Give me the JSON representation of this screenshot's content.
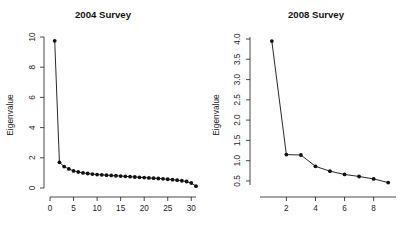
{
  "figure": {
    "background": "#ffffff",
    "foreground": "#111111",
    "panels": 2
  },
  "chart_data": [
    {
      "type": "line",
      "title": "2004 Survey",
      "xlabel": "",
      "ylabel": "Eigenvalue",
      "grid": false,
      "legend": "none",
      "marker": "filled-circle",
      "xlim": [
        0,
        31
      ],
      "ylim": [
        0,
        10
      ],
      "xticks": [
        0,
        5,
        10,
        15,
        20,
        25,
        30
      ],
      "yticks": [
        0,
        2,
        4,
        6,
        8,
        10
      ],
      "x": [
        1,
        2,
        3,
        4,
        5,
        6,
        7,
        8,
        9,
        10,
        11,
        12,
        13,
        14,
        15,
        16,
        17,
        18,
        19,
        20,
        21,
        22,
        23,
        24,
        25,
        26,
        27,
        28,
        29,
        30,
        31
      ],
      "values": [
        9.75,
        1.7,
        1.42,
        1.26,
        1.13,
        1.06,
        1.0,
        0.96,
        0.92,
        0.89,
        0.87,
        0.85,
        0.83,
        0.81,
        0.79,
        0.77,
        0.75,
        0.73,
        0.71,
        0.69,
        0.67,
        0.65,
        0.63,
        0.61,
        0.58,
        0.55,
        0.52,
        0.48,
        0.43,
        0.33,
        0.12
      ]
    },
    {
      "type": "line",
      "title": "2008 Survey",
      "xlabel": "",
      "ylabel": "Eigenvalue",
      "grid": false,
      "legend": "none",
      "marker": "filled-circle",
      "xlim": [
        0.6,
        9.4
      ],
      "ylim": [
        0.4,
        4.05
      ],
      "xticks": [
        2,
        4,
        6,
        8
      ],
      "yticks": [
        "0.5",
        "1.0",
        "1.5",
        "2.0",
        "2.5",
        "3.0",
        "3.5",
        "4.0"
      ],
      "ytick_values": [
        0.5,
        1.0,
        1.5,
        2.0,
        2.5,
        3.0,
        3.5,
        4.0
      ],
      "x": [
        1,
        2,
        3,
        4,
        5,
        6,
        7,
        8,
        9
      ],
      "values": [
        3.95,
        1.15,
        1.14,
        0.86,
        0.74,
        0.66,
        0.61,
        0.55,
        0.46
      ]
    }
  ]
}
